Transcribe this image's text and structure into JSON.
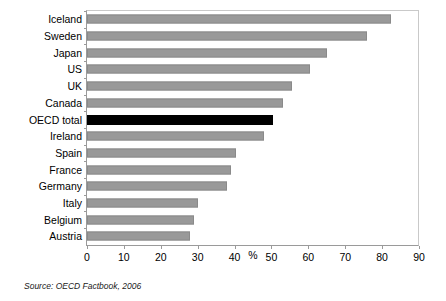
{
  "chart_data": {
    "type": "bar",
    "orientation": "horizontal",
    "title": "",
    "xlabel": "%",
    "ylabel": "",
    "xlim": [
      0,
      90
    ],
    "xticks": [
      0,
      10,
      20,
      30,
      40,
      50,
      60,
      70,
      80,
      90
    ],
    "grid": false,
    "legend": false,
    "bar_color": "#999999",
    "highlight_color": "#000000",
    "highlight_category": "OECD total",
    "categories": [
      "Iceland",
      "Sweden",
      "Japan",
      "US",
      "UK",
      "Canada",
      "OECD total",
      "Ireland",
      "Spain",
      "France",
      "Germany",
      "Italy",
      "Belgium",
      "Austria"
    ],
    "values": [
      82.5,
      76,
      65,
      60.5,
      55.5,
      53,
      50.5,
      48,
      40.5,
      39,
      38,
      30,
      29,
      28
    ]
  },
  "source": {
    "note": "Source:  OECD Factbook, 2006"
  }
}
